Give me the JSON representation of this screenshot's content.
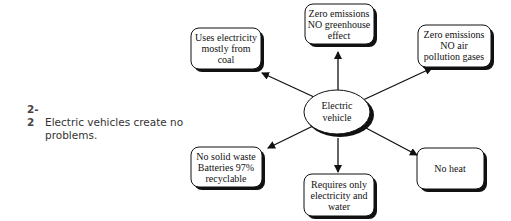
{
  "caption": {
    "number": "2-2",
    "line1": "Electric vehicles create no",
    "line2": "problems."
  },
  "diagram": {
    "center": {
      "lines": [
        "Electric",
        "vehicle"
      ]
    },
    "nodes": [
      {
        "id": "coal",
        "lines": [
          "Uses electricity",
          "mostly from",
          "coal"
        ]
      },
      {
        "id": "greenhouse",
        "lines": [
          "Zero emissions",
          "NO greenhouse",
          "effect"
        ]
      },
      {
        "id": "air",
        "lines": [
          "Zero emissions",
          "NO air",
          "pollution gases"
        ]
      },
      {
        "id": "waste",
        "lines": [
          "No solid waste",
          "Batteries 97%",
          "recyclable"
        ]
      },
      {
        "id": "water",
        "lines": [
          "Requires only",
          "electricity and",
          "water"
        ]
      },
      {
        "id": "heat",
        "lines": [
          "No heat"
        ]
      }
    ]
  }
}
